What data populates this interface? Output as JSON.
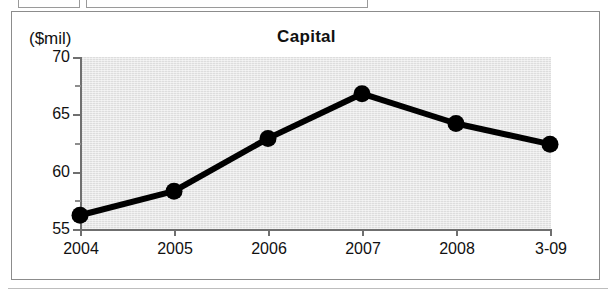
{
  "figure": {
    "axis_unit_label": "($mil)",
    "border_color": "#8c8c8c",
    "plot_background": "#dddddd",
    "series_color": "#000000"
  },
  "chart_data": {
    "type": "line",
    "title": "Capital",
    "xlabel": "",
    "ylabel": "($mil)",
    "categories": [
      "2004",
      "2005",
      "2006",
      "2007",
      "2008",
      "3-09"
    ],
    "values": [
      56.2,
      58.3,
      62.9,
      66.8,
      64.2,
      62.4
    ],
    "series": [
      {
        "name": "Capital",
        "values": [
          56.2,
          58.3,
          62.9,
          66.8,
          64.2,
          62.4
        ]
      }
    ],
    "ylim": [
      55,
      70
    ],
    "ytick_labels": [
      "70",
      "65",
      "60",
      "55"
    ],
    "yticks": [
      70,
      65,
      60,
      55
    ],
    "ytick_minor": [
      67.5,
      62.5,
      57.5
    ],
    "grid": false,
    "legend": false,
    "marker": "filled-circle",
    "line_width_px": 6
  }
}
